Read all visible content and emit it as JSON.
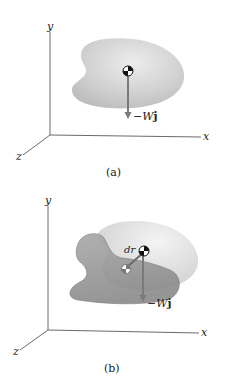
{
  "figures": [
    {
      "id": "a",
      "caption": "(a)",
      "axes": {
        "x_label": "x",
        "y_label": "y",
        "z_label": "z"
      },
      "body": {
        "description": "rigid body with center of gravity",
        "fill": "#cfcfcf"
      },
      "force": {
        "prefix": "−W",
        "unit_vector": "j"
      },
      "center_of_gravity_marker": true
    },
    {
      "id": "b",
      "caption": "(b)",
      "axes": {
        "x_label": "x",
        "y_label": "y",
        "z_label": "z"
      },
      "body": {
        "description": "displaced body overlapping original position",
        "fill_front": "#9a9a9a",
        "fill_back": "#e2e2e2"
      },
      "displacement_label": "dr",
      "force": {
        "prefix": "−W",
        "unit_vector": "j"
      },
      "center_of_gravity_markers": 2
    }
  ],
  "colors": {
    "axis": "#444444",
    "arrow": "#7a7a7a",
    "body_light": "#d9d9d9",
    "body_dark": "#8f8f8f"
  }
}
